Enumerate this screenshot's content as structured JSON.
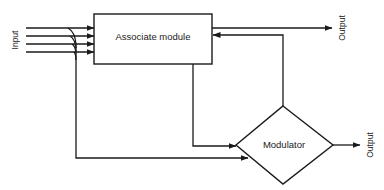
{
  "diagram": {
    "type": "block-diagram",
    "nodes": [
      {
        "id": "associate",
        "label": "Associate module",
        "shape": "rectangle"
      },
      {
        "id": "modulator",
        "label": "Modulator",
        "shape": "diamond"
      }
    ],
    "labels": {
      "input": "Input",
      "output_top": "Output",
      "output_bottom": "Output"
    },
    "edges": [
      {
        "from": "Input",
        "to": "associate",
        "count": 4
      },
      {
        "from": "associate",
        "to": "Output"
      },
      {
        "from": "modulator",
        "to": "associate",
        "kind": "feedback"
      },
      {
        "from": "associate",
        "to": "modulator"
      },
      {
        "from": "Input",
        "to": "modulator"
      },
      {
        "from": "modulator",
        "to": "Output"
      }
    ],
    "colors": {
      "line": "#1a1a1a",
      "background": "#ffffff"
    }
  }
}
